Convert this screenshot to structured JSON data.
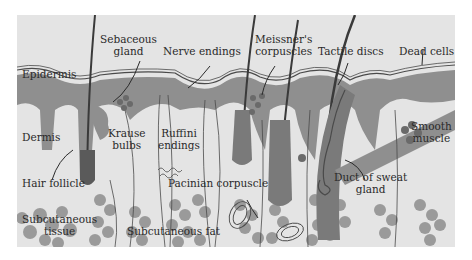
{
  "figure": {
    "colors": {
      "background": "#e4e4e4",
      "epidermis": "#8f8f8f",
      "fat_cells": "#9a9a9a",
      "hair_shaft": "#3a3a3a",
      "lines": "#4a4a4a",
      "text": "#2a2a2a"
    },
    "labels": {
      "sebaceous_gland": [
        "Sebaceous",
        "gland"
      ],
      "nerve_endings": "Nerve endings",
      "meissners_corpuscles": [
        "Meissner's",
        "corpuscles"
      ],
      "tactile_discs": "Tactile discs",
      "dead_cells": "Dead cells",
      "epidermis": "Epidermis",
      "dermis": "Dermis",
      "krause_bulbs": [
        "Krause",
        "bulbs"
      ],
      "ruffini_endings": [
        "Ruffini",
        "endings"
      ],
      "smooth_muscle": [
        "Smooth",
        "muscle"
      ],
      "hair_follicle": "Hair follicle",
      "pacinian_corpuscle": "Pacinian corpuscle",
      "duct_of_sweat_gland": [
        "Duct of sweat",
        "gland"
      ],
      "subcutaneous_tissue": [
        "Subcutaneous",
        "tissue"
      ],
      "subcutaneous_fat": "Subcutaneous fat"
    }
  }
}
